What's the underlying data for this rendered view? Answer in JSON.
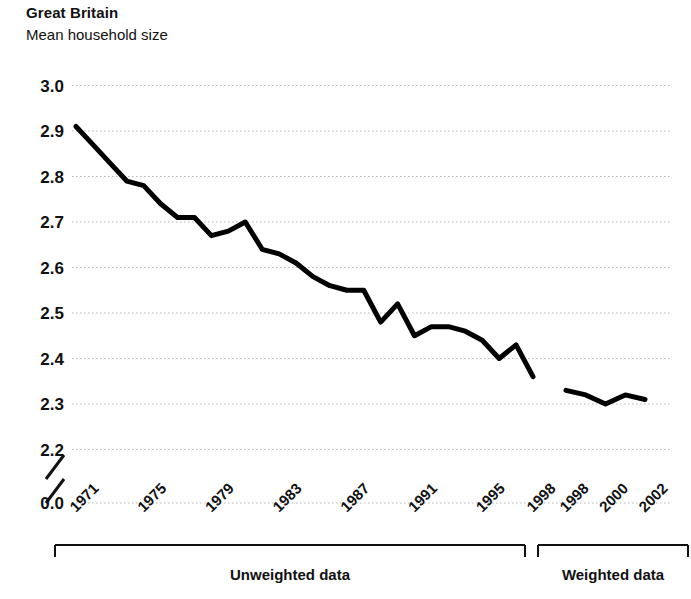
{
  "header": {
    "title": "Great Britain",
    "subtitle": "Mean household size"
  },
  "chart_data": {
    "type": "line",
    "title": "Great Britain",
    "subtitle": "Mean household size",
    "xlabel": "",
    "ylabel": "",
    "ylim": [
      2.2,
      3.0
    ],
    "y_axis_break": true,
    "y_break_label": "0.0",
    "yticks": [
      "3.0",
      "2.9",
      "2.8",
      "2.7",
      "2.6",
      "2.5",
      "2.4",
      "2.3",
      "2.2",
      "0.0"
    ],
    "ytick_values": [
      3.0,
      2.9,
      2.8,
      2.7,
      2.6,
      2.5,
      2.4,
      2.3,
      2.2,
      0.0
    ],
    "xticks": [
      "1971",
      "1975",
      "1979",
      "1983",
      "1987",
      "1991",
      "1995",
      "1998",
      "1998",
      "2000",
      "2002"
    ],
    "grid": true,
    "grid_style": "dotted-horizontal",
    "legend_position": "none",
    "line_color": "#000000",
    "line_width": 5,
    "series": [
      {
        "name": "Unweighted data",
        "x": [
          1971,
          1972,
          1973,
          1974,
          1975,
          1976,
          1977,
          1978,
          1979,
          1980,
          1981,
          1982,
          1983,
          1984,
          1985,
          1986,
          1987,
          1988,
          1989,
          1990,
          1991,
          1992,
          1993,
          1994,
          1995,
          1996,
          1997,
          1998
        ],
        "values": [
          2.91,
          2.87,
          2.83,
          2.79,
          2.78,
          2.74,
          2.71,
          2.71,
          2.67,
          2.68,
          2.7,
          2.64,
          2.63,
          2.61,
          2.58,
          2.56,
          2.55,
          2.55,
          2.48,
          2.52,
          2.45,
          2.47,
          2.47,
          2.46,
          2.44,
          2.4,
          2.43,
          2.36
        ]
      },
      {
        "name": "Weighted data",
        "x": [
          1998,
          1999,
          2000,
          2001,
          2002
        ],
        "values": [
          2.33,
          2.32,
          2.3,
          2.32,
          2.31
        ]
      }
    ],
    "groups": [
      {
        "label": "Unweighted data",
        "start_year": 1971,
        "end_year": 1998
      },
      {
        "label": "Weighted data",
        "start_year": 1998,
        "end_year": 2002
      }
    ]
  }
}
